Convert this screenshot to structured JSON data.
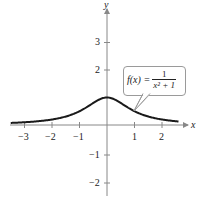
{
  "chart_data": {
    "type": "line",
    "title": "",
    "function": "f(x) = 1/(x^2+1)",
    "xlabel": "x",
    "ylabel": "y",
    "xlim": [
      -3.5,
      2.6
    ],
    "ylim": [
      -2.5,
      3.8
    ],
    "x_ticks": [
      -3,
      -2,
      -1,
      1,
      2
    ],
    "y_ticks": [
      3,
      2,
      -1,
      -2
    ],
    "x_tick_labels": [
      "−3",
      "−2",
      "−1",
      "1",
      "2"
    ],
    "y_tick_labels": [
      "3",
      "2",
      "−1",
      "−2"
    ],
    "grid": false,
    "series": [
      {
        "name": "f(x) = 1/(x²+1)",
        "x": [
          -3.5,
          -3,
          -2.5,
          -2,
          -1.5,
          -1,
          -0.5,
          0,
          0.5,
          1,
          1.5,
          2,
          2.5
        ],
        "values": [
          0.075,
          0.1,
          0.138,
          0.2,
          0.308,
          0.5,
          0.8,
          1.0,
          0.8,
          0.5,
          0.308,
          0.2,
          0.138
        ]
      }
    ],
    "annotations": [
      {
        "text": "f(x) = 1/(x²+1)",
        "type": "callout",
        "points_to": [
          1.0,
          0.5
        ]
      }
    ]
  },
  "labels": {
    "x_axis": "x",
    "y_axis": "y",
    "formula_lhs": "f(x) =",
    "formula_num": "1",
    "formula_den": "x² + 1",
    "x_ticks": [
      "−3",
      "−2",
      "−1",
      "1",
      "2"
    ],
    "y_ticks": [
      "3",
      "2",
      "−1",
      "−2"
    ]
  },
  "colors": {
    "curve": "#1a1a1a",
    "axis": "#888888",
    "callout_border": "#9a9a9a"
  }
}
